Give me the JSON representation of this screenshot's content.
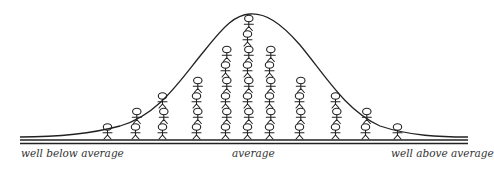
{
  "diagram": {
    "type": "bell-curve-distribution",
    "labels": {
      "left": "well below average",
      "center": "average",
      "right": "well above average"
    },
    "columns": [
      {
        "x": 108,
        "count": 1
      },
      {
        "x": 136,
        "count": 2
      },
      {
        "x": 163,
        "count": 3
      },
      {
        "x": 197,
        "count": 4
      },
      {
        "x": 226,
        "count": 6
      },
      {
        "x": 248,
        "count": 8
      },
      {
        "x": 270,
        "count": 6
      },
      {
        "x": 300,
        "count": 4
      },
      {
        "x": 336,
        "count": 3
      },
      {
        "x": 366,
        "count": 2
      },
      {
        "x": 398,
        "count": 1
      }
    ],
    "colors": {
      "ink": "#222222",
      "background": "#ffffff"
    }
  }
}
